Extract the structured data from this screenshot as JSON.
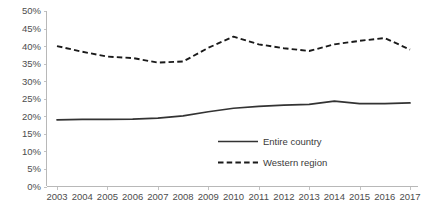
{
  "chart_data": {
    "type": "line",
    "title": "",
    "xlabel": "",
    "ylabel": "",
    "categories": [
      "2003",
      "2004",
      "2005",
      "2006",
      "2007",
      "2008",
      "2009",
      "2010",
      "2011",
      "2012",
      "2013",
      "2014",
      "2015",
      "2016",
      "2017"
    ],
    "x": [
      2003,
      2004,
      2005,
      2006,
      2007,
      2008,
      2009,
      2010,
      2011,
      2012,
      2013,
      2014,
      2015,
      2016,
      2017
    ],
    "ylim": [
      0,
      50
    ],
    "ytick_labels": [
      "0%",
      "5%",
      "10%",
      "15%",
      "20%",
      "25%",
      "30%",
      "35%",
      "40%",
      "45%",
      "50%"
    ],
    "ytick_values": [
      0,
      5,
      10,
      15,
      20,
      25,
      30,
      35,
      40,
      45,
      50
    ],
    "grid": false,
    "legend_position": "center-right-inside",
    "series": [
      {
        "name": "Entire country",
        "style": "solid",
        "color": "#333333",
        "values": [
          19.0,
          19.1,
          19.1,
          19.2,
          19.5,
          20.1,
          21.3,
          22.3,
          22.8,
          23.2,
          23.4,
          24.3,
          23.6,
          23.6,
          23.8
        ]
      },
      {
        "name": "Western region",
        "style": "dashed",
        "color": "#1a1a1a",
        "values": [
          40.0,
          38.4,
          37.0,
          36.6,
          35.3,
          35.6,
          39.5,
          42.7,
          40.5,
          39.4,
          38.6,
          40.5,
          41.5,
          42.3,
          39.0
        ]
      }
    ]
  },
  "legend": {
    "items": [
      {
        "label": "Entire country",
        "style": "solid"
      },
      {
        "label": "Western region",
        "style": "dashed"
      }
    ]
  },
  "colors": {
    "axis": "#b8b8b8",
    "tick_text": "#4d4d4d",
    "series_solid": "#333333",
    "series_dashed": "#1a1a1a",
    "background": "#ffffff"
  }
}
